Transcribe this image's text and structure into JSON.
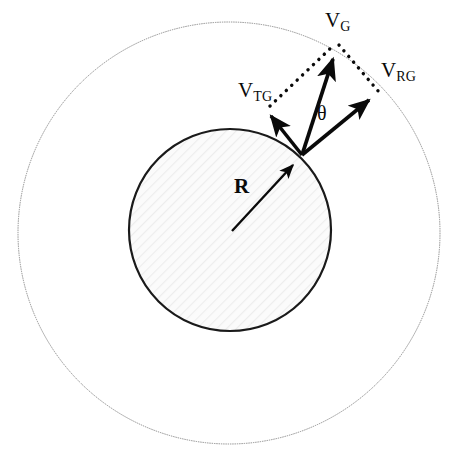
{
  "figure": {
    "background_color": "#ffffff",
    "width": 461,
    "height": 453
  },
  "colors": {
    "outer_circle_stroke": "#8d8d8d",
    "inner_circle_stroke": "#1a1a1a",
    "inner_circle_fill": "#f7f7f7",
    "hatch": "#e6e6e6",
    "vector_stroke": "#0a0a0a",
    "dotted_stroke": "#0a0a0a",
    "label_color": "#0a0a0a"
  },
  "geometry": {
    "outer_circle": {
      "cx": 229,
      "cy": 233,
      "r": 211,
      "stroke_width": 1
    },
    "inner_circle": {
      "cx": 230,
      "cy": 230,
      "r": 101,
      "stroke_width": 2.2
    },
    "vector_origin": {
      "x": 302,
      "y": 155
    },
    "radius_origin": {
      "x": 232,
      "y": 231
    }
  },
  "labels": {
    "v_g": {
      "base": "V",
      "sub": "G",
      "x": 325,
      "y": 10
    },
    "v_tg": {
      "base": "V",
      "sub": "TG",
      "x": 238,
      "y": 80
    },
    "v_rg": {
      "base": "V",
      "sub": "RG",
      "x": 381,
      "y": 60
    },
    "theta": {
      "text": "θ",
      "x": 317,
      "y": 103
    },
    "radius": {
      "text": "R",
      "x": 234,
      "y": 176
    }
  },
  "vectors": [
    {
      "name": "v-g-vector",
      "label": "V_G",
      "description": "resultant velocity of the body relative to ground",
      "from": {
        "x": 302,
        "y": 155
      },
      "to": {
        "x": 337,
        "y": 50
      },
      "style": "solid-arrow"
    },
    {
      "name": "v-tg-vector",
      "label": "V_TG",
      "description": "tangential component of velocity",
      "from": {
        "x": 302,
        "y": 155
      },
      "to": {
        "x": 266,
        "y": 110
      },
      "style": "solid-arrow"
    },
    {
      "name": "v-rg-vector",
      "label": "V_RG",
      "description": "radial component of velocity",
      "from": {
        "x": 302,
        "y": 155
      },
      "to": {
        "x": 375,
        "y": 95
      },
      "style": "solid-arrow"
    },
    {
      "name": "radius-vector",
      "label": "R",
      "description": "radius of the inner circle",
      "from": {
        "x": 232,
        "y": 231
      },
      "to": {
        "x": 298,
        "y": 160
      },
      "style": "solid-arrow"
    }
  ],
  "construction_lines": [
    {
      "name": "dotted-tg-to-g",
      "from": {
        "x": 270,
        "y": 106
      },
      "to": {
        "x": 335,
        "y": 44
      },
      "style": "dotted"
    },
    {
      "name": "dotted-g-to-rg",
      "from": {
        "x": 339,
        "y": 45
      },
      "to": {
        "x": 379,
        "y": 92
      },
      "style": "dotted"
    }
  ]
}
